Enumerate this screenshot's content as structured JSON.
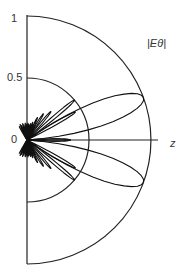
{
  "chart_data": {
    "type": "polar-line",
    "title": "",
    "series_label": "|Eθ|",
    "axis_label_z": "z",
    "radial_ticks": [
      "0",
      "0.5",
      "1"
    ],
    "radial_range": [
      0,
      1
    ],
    "angular_range_deg": [
      0,
      180
    ],
    "angle_convention": "measured from +z axis (horizontal right); plot shows upper half (0–90°) and lower half mirrored",
    "grid_circles": [
      0.5,
      1
    ],
    "main_lobe": {
      "peak_angle_deg_from_z": 20,
      "peak_value": 1.0
    },
    "sidelobes": [
      {
        "angle_deg_from_z": 40,
        "value": 0.5
      },
      {
        "angle_deg_from_z": 30,
        "value": 0.45
      },
      {
        "angle_deg_from_z": 0,
        "value": 0.35
      },
      {
        "angle_deg_from_z": 50,
        "value": 0.3
      },
      {
        "angle_deg_from_z": 58,
        "value": 0.25
      },
      {
        "angle_deg_from_z": 65,
        "value": 0.2
      },
      {
        "angle_deg_from_z": 72,
        "value": 0.15
      },
      {
        "angle_deg_from_z": 80,
        "value": 0.12
      },
      {
        "angle_deg_from_z": 88,
        "value": 0.1
      }
    ],
    "symmetric_about_z_axis": true
  },
  "labels": {
    "tick_0": "0",
    "tick_half": "0.5",
    "tick_one": "1",
    "z": "z",
    "series": "|Eθ|"
  }
}
